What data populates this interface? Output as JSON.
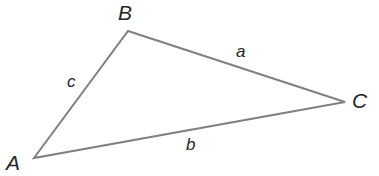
{
  "figure": {
    "background_color": "#ffffff",
    "stroke_color": "#808080",
    "text_color": "#262626",
    "stroke_width": 2
  },
  "vertices": [
    {
      "name": "A",
      "label": "A",
      "x": 34,
      "y": 158
    },
    {
      "name": "B",
      "label": "B",
      "x": 128,
      "y": 31
    },
    {
      "name": "C",
      "label": "C",
      "x": 345,
      "y": 102
    }
  ],
  "sides": [
    {
      "name": "a",
      "label": "a",
      "from": "B",
      "to": "C"
    },
    {
      "name": "b",
      "label": "b",
      "from": "A",
      "to": "C"
    },
    {
      "name": "c",
      "label": "c",
      "from": "A",
      "to": "B"
    }
  ],
  "path": {
    "points": "34,158 128,31 345,102"
  }
}
